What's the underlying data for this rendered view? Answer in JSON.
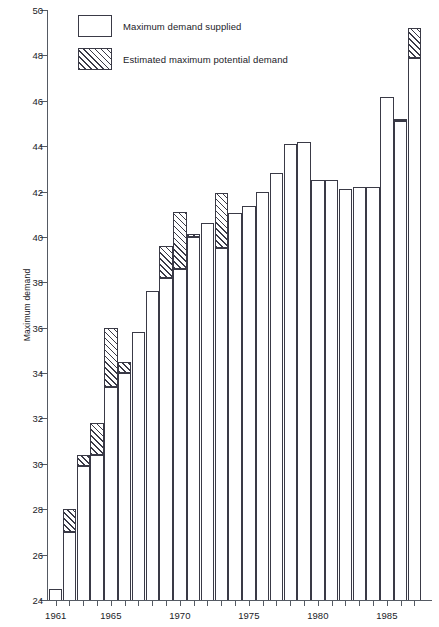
{
  "chart_data": {
    "type": "bar",
    "title": "",
    "xlabel": "",
    "ylabel": "Maximum demand",
    "ylim": [
      24,
      50
    ],
    "ytick_step": 2,
    "yticks": [
      24,
      26,
      28,
      30,
      32,
      34,
      36,
      38,
      40,
      42,
      44,
      46,
      48,
      50
    ],
    "grid": false,
    "legend_position": "top-left",
    "legend": [
      {
        "key": "supplied",
        "label": "Maximum demand supplied",
        "fill": "solid"
      },
      {
        "key": "potential",
        "label": "Estimated maximum potential demand",
        "fill": "hatched"
      }
    ],
    "categories": [
      1961,
      1962,
      1963,
      1964,
      1965,
      1966,
      1967,
      1968,
      1969,
      1970,
      1971,
      1972,
      1973,
      1974,
      1975,
      1976,
      1977,
      1978,
      1979,
      1980,
      1981,
      1982,
      1983,
      1984,
      1985,
      1986,
      1987
    ],
    "xtick_labels": [
      "1961",
      "1965",
      "1970",
      "1975",
      "1980",
      "1985"
    ],
    "xtick_years": [
      1961,
      1965,
      1970,
      1975,
      1980,
      1985
    ],
    "series": [
      {
        "name": "Maximum demand supplied",
        "values": [
          24.5,
          27.0,
          29.9,
          30.4,
          33.4,
          34.0,
          35.8,
          37.6,
          38.2,
          38.6,
          40.0,
          40.6,
          39.5,
          41.05,
          41.35,
          42.0,
          42.8,
          44.1,
          44.2,
          42.5,
          42.5,
          42.1,
          42.2,
          null,
          46.15,
          45.1,
          47.9
        ]
      },
      {
        "name": "Estimated maximum potential demand",
        "values": [
          null,
          28.0,
          30.4,
          31.8,
          36.0,
          34.5,
          null,
          null,
          39.6,
          41.1,
          40.15,
          null,
          41.95,
          null,
          null,
          null,
          null,
          null,
          null,
          null,
          null,
          null,
          null,
          null,
          null,
          45.2,
          49.2
        ]
      }
    ],
    "bars": [
      {
        "year": 1961,
        "supplied": 24.5,
        "potential": null
      },
      {
        "year": 1962,
        "supplied": 27.0,
        "potential": 28.0
      },
      {
        "year": 1963,
        "supplied": 29.9,
        "potential": 30.4
      },
      {
        "year": 1964,
        "supplied": 30.4,
        "potential": 31.8
      },
      {
        "year": 1965,
        "supplied": 33.4,
        "potential": 36.0
      },
      {
        "year": 1966,
        "supplied": 34.0,
        "potential": 34.5
      },
      {
        "year": 1967,
        "supplied": 35.8,
        "potential": null
      },
      {
        "year": 1968,
        "supplied": 37.6,
        "potential": null
      },
      {
        "year": 1969,
        "supplied": 38.2,
        "potential": 39.6
      },
      {
        "year": 1970,
        "supplied": 38.6,
        "potential": 41.1
      },
      {
        "year": 1971,
        "supplied": 40.0,
        "potential": 40.15
      },
      {
        "year": 1972,
        "supplied": 40.6,
        "potential": null
      },
      {
        "year": 1973,
        "supplied": 39.5,
        "potential": 41.95
      },
      {
        "year": 1974,
        "supplied": 41.05,
        "potential": null
      },
      {
        "year": 1975,
        "supplied": 41.35,
        "potential": null
      },
      {
        "year": 1976,
        "supplied": 42.0,
        "potential": null
      },
      {
        "year": 1977,
        "supplied": 42.8,
        "potential": null
      },
      {
        "year": 1978,
        "supplied": 44.1,
        "potential": null
      },
      {
        "year": 1979,
        "supplied": 44.2,
        "potential": null
      },
      {
        "year": 1980,
        "supplied": 42.5,
        "potential": null
      },
      {
        "year": 1981,
        "supplied": 42.5,
        "potential": null
      },
      {
        "year": 1982,
        "supplied": 42.1,
        "potential": null
      },
      {
        "year": 1983,
        "supplied": 42.2,
        "potential": null
      },
      {
        "year": 1984,
        "supplied": 42.2,
        "potential": null
      },
      {
        "year": 1985,
        "supplied": 46.15,
        "potential": null
      },
      {
        "year": 1986,
        "supplied": 45.1,
        "potential": 45.2
      },
      {
        "year": 1987,
        "supplied": 47.9,
        "potential": 49.2
      }
    ],
    "colors": {
      "axis": "#555a63",
      "bar_outline": "#3a3a46",
      "bar_fill": "#ffffff",
      "text": "#1b1b28"
    }
  }
}
